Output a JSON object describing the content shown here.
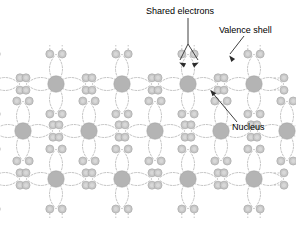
{
  "figure": {
    "background_color": "#ffffff"
  },
  "annotations": [
    {
      "id": "shared-electrons",
      "label": "Shared electrons",
      "text_x": 146,
      "text_y": 14,
      "anchor": "start",
      "leader": "M188 18 L188 44 L180 60 M188 44 L198 60",
      "arrows": [
        {
          "x": 179.2,
          "y": 62.5,
          "angle": 207
        },
        {
          "x": 198.8,
          "y": 62.5,
          "angle": 333
        }
      ]
    },
    {
      "id": "valence-shell",
      "label": "Valence shell",
      "text_x": 219,
      "text_y": 33,
      "anchor": "start",
      "leader": "M244 36 L230 54",
      "arrows": [
        {
          "x": 229.2,
          "y": 55.4,
          "angle": 232
        }
      ]
    },
    {
      "id": "nucleus",
      "label": "Nucleus",
      "text_x": 232,
      "text_y": 130,
      "anchor": "start",
      "leader": "M237 122 L211 91",
      "arrows": [
        {
          "x": 210.2,
          "y": 89.8,
          "angle": 230
        }
      ]
    }
  ],
  "colors": {
    "nucleus_fill": "#b4b4b4",
    "electron_fill": "#c9c9c9",
    "orbital_stroke": "#b9b9b9",
    "leader_stroke": "#2b2b2b",
    "text": "#000000"
  },
  "lattice": {
    "description": "Staggered grid of atoms, each with a nucleus and four valence electron pairs joined by dashed elliptical orbital shells.",
    "nucleus_radius": 8.2,
    "electron_radius": 4.0,
    "electron_core_radius": 2.0,
    "pair_half_gap": 6.2,
    "orbital_reach": 30,
    "orbital_bulge": 13,
    "rows": [
      {
        "y": 84,
        "x": [
          -10,
          56,
          122,
          188,
          254
        ]
      },
      {
        "y": 131,
        "x": [
          23,
          89,
          155,
          221,
          287
        ]
      },
      {
        "y": 179,
        "x": [
          -10,
          56,
          122,
          188,
          254
        ]
      }
    ],
    "atoms": [
      {
        "cx": -10,
        "cy": 84
      },
      {
        "cx": 56,
        "cy": 84
      },
      {
        "cx": 122,
        "cy": 84
      },
      {
        "cx": 188,
        "cy": 84
      },
      {
        "cx": 254,
        "cy": 84
      },
      {
        "cx": 23,
        "cy": 131
      },
      {
        "cx": 89,
        "cy": 131
      },
      {
        "cx": 155,
        "cy": 131
      },
      {
        "cx": 221,
        "cy": 131
      },
      {
        "cx": 287,
        "cy": 131
      },
      {
        "cx": -10,
        "cy": 179
      },
      {
        "cx": 56,
        "cy": 179
      },
      {
        "cx": 122,
        "cy": 179
      },
      {
        "cx": 188,
        "cy": 179
      },
      {
        "cx": 254,
        "cy": 179
      }
    ]
  }
}
